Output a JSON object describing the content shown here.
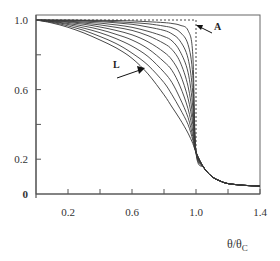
{
  "chart_data": {
    "type": "line",
    "title": "",
    "xlabel": "θ/θC",
    "ylabel": "",
    "xlim": [
      0,
      1.4
    ],
    "ylim": [
      0,
      1.08
    ],
    "grid": false,
    "legend": "none",
    "x_ticks": [
      0.2,
      0.4,
      0.6,
      0.8,
      1.0,
      1.2,
      1.4
    ],
    "x_tick_labels": [
      "0.2",
      "",
      "0.6",
      "",
      "1.0",
      "",
      "1.4"
    ],
    "y_ticks": [
      0,
      0.2,
      0.4,
      0.6,
      0.8,
      1.0
    ],
    "y_tick_labels": [
      "0",
      "0.2",
      "",
      "0.6",
      "",
      "1.0"
    ],
    "annotations": [
      {
        "text": "A",
        "target": "dashed step curve at θ/θC = 1.0"
      },
      {
        "text": "L",
        "target": "outermost (lowest) solid curve"
      }
    ],
    "x": [
      0,
      0.1,
      0.2,
      0.3,
      0.4,
      0.5,
      0.6,
      0.7,
      0.8,
      0.85,
      0.9,
      0.95,
      0.98,
      1.0,
      1.05,
      1.1,
      1.15,
      1.2,
      1.3,
      1.4
    ],
    "series": [
      {
        "name": "A",
        "style": "dashed",
        "values": [
          1.0,
          1.0,
          1.0,
          1.0,
          1.0,
          1.0,
          1.0,
          1.0,
          1.0,
          1.0,
          1.0,
          1.0,
          1.0,
          0.24,
          0.15,
          0.1,
          0.075,
          0.06,
          0.05,
          0.045
        ]
      },
      {
        "name": "curve-1",
        "values": [
          1.0,
          1.0,
          1.0,
          0.999,
          0.998,
          0.997,
          0.995,
          0.99,
          0.985,
          0.98,
          0.97,
          0.94,
          0.8,
          0.24,
          0.15,
          0.1,
          0.075,
          0.06,
          0.05,
          0.045
        ]
      },
      {
        "name": "curve-2",
        "values": [
          1.0,
          0.999,
          0.998,
          0.997,
          0.995,
          0.99,
          0.985,
          0.978,
          0.965,
          0.955,
          0.93,
          0.86,
          0.68,
          0.24,
          0.15,
          0.1,
          0.075,
          0.06,
          0.05,
          0.045
        ]
      },
      {
        "name": "curve-3",
        "values": [
          1.0,
          0.998,
          0.996,
          0.993,
          0.99,
          0.984,
          0.975,
          0.96,
          0.94,
          0.92,
          0.88,
          0.78,
          0.58,
          0.24,
          0.15,
          0.1,
          0.075,
          0.06,
          0.05,
          0.045
        ]
      },
      {
        "name": "curve-4",
        "values": [
          1.0,
          0.997,
          0.993,
          0.988,
          0.982,
          0.972,
          0.958,
          0.935,
          0.905,
          0.88,
          0.82,
          0.7,
          0.5,
          0.24,
          0.15,
          0.1,
          0.075,
          0.06,
          0.05,
          0.045
        ]
      },
      {
        "name": "curve-5",
        "values": [
          1.0,
          0.996,
          0.99,
          0.982,
          0.972,
          0.958,
          0.94,
          0.91,
          0.865,
          0.83,
          0.76,
          0.62,
          0.44,
          0.24,
          0.15,
          0.1,
          0.075,
          0.06,
          0.05,
          0.045
        ]
      },
      {
        "name": "curve-6",
        "values": [
          1.0,
          0.994,
          0.986,
          0.975,
          0.96,
          0.94,
          0.915,
          0.875,
          0.815,
          0.77,
          0.69,
          0.55,
          0.4,
          0.24,
          0.15,
          0.1,
          0.075,
          0.06,
          0.05,
          0.045
        ]
      },
      {
        "name": "curve-7",
        "values": [
          1.0,
          0.992,
          0.98,
          0.965,
          0.945,
          0.918,
          0.885,
          0.835,
          0.76,
          0.71,
          0.62,
          0.49,
          0.36,
          0.24,
          0.15,
          0.1,
          0.075,
          0.06,
          0.05,
          0.045
        ]
      },
      {
        "name": "curve-8",
        "values": [
          1.0,
          0.99,
          0.974,
          0.953,
          0.927,
          0.893,
          0.85,
          0.79,
          0.7,
          0.64,
          0.55,
          0.44,
          0.33,
          0.24,
          0.15,
          0.1,
          0.075,
          0.06,
          0.05,
          0.045
        ]
      },
      {
        "name": "curve-9",
        "values": [
          1.0,
          0.987,
          0.966,
          0.94,
          0.905,
          0.865,
          0.81,
          0.74,
          0.64,
          0.57,
          0.49,
          0.4,
          0.31,
          0.24,
          0.15,
          0.1,
          0.075,
          0.06,
          0.05,
          0.045
        ]
      },
      {
        "name": "L",
        "values": [
          1.0,
          0.983,
          0.958,
          0.925,
          0.885,
          0.84,
          0.78,
          0.69,
          0.57,
          0.5,
          0.43,
          0.35,
          0.29,
          0.24,
          0.15,
          0.1,
          0.075,
          0.06,
          0.05,
          0.045
        ]
      }
    ]
  },
  "labels": {
    "annotation_a": "A",
    "annotation_l": "L",
    "x_axis_main": "θ/θ",
    "x_axis_sub": "C"
  }
}
